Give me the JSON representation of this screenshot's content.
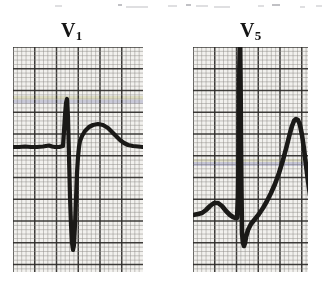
{
  "figure": {
    "kind": "ecg-strip-pair",
    "background_color": "#ffffff",
    "paper_color": "#f2f1ee",
    "grid_color_fine": "#8d8a86",
    "grid_color_bold": "#2e2c2a",
    "trace_color": "#1a1917",
    "tint_blue": "#6f74b4",
    "tint_yellow": "#c9c98a"
  },
  "top_artifacts": [
    {
      "x": 55,
      "y": 5,
      "w": 7
    },
    {
      "x": 118,
      "y": 4,
      "w": 4,
      "dark": true
    },
    {
      "x": 126,
      "y": 6,
      "w": 22
    },
    {
      "x": 168,
      "y": 5,
      "w": 9
    },
    {
      "x": 186,
      "y": 4,
      "w": 5,
      "dark": true
    },
    {
      "x": 196,
      "y": 5,
      "w": 12
    },
    {
      "x": 214,
      "y": 6,
      "w": 16
    },
    {
      "x": 258,
      "y": 5,
      "w": 6
    },
    {
      "x": 272,
      "y": 4,
      "w": 8,
      "dark": true
    },
    {
      "x": 300,
      "y": 6,
      "w": 5
    },
    {
      "x": 316,
      "y": 5,
      "w": 6
    }
  ],
  "panels": [
    {
      "id": "v1",
      "label_main": "V",
      "label_sub": "1",
      "label_x": 61,
      "label_y": 20,
      "box": {
        "x": 13,
        "y": 47,
        "w": 130,
        "h": 225
      },
      "grid": {
        "fine_step": 4.35,
        "bold_every": 5,
        "bold_width": 1.5,
        "fine_width": 0.8
      },
      "baseline_y": 98,
      "tint_bands": [
        {
          "y": 53,
          "h": 3.5,
          "color": "#6f74b4",
          "opacity": 0.3
        },
        {
          "y": 49,
          "h": 3.0,
          "color": "#c9c98a",
          "opacity": 0.4
        }
      ],
      "trace_width": 4.2,
      "trace_points": "0,100 6,100 12,99.5 18,100 24,100 30,99.5 33,99 36,98.5 39,99.5 42,100 46,100 48,99.5 50,99 51,84 52,68 53,56 54,52 55,70 56,110 57,150 58,178 59,196 60,203 61,198 62,178 63,152 64,126 65,110 66,100 67,94 69,89 72,84 76,80 80,78 85,77 90,78 95,81 99,85 103,89 107,93 111,96 115,98 120,99 125,99.5 130,100 130,100",
      "waveform_description": "rS complex: tiny r spike, deep S wave, broad upright T"
    },
    {
      "id": "v5",
      "label_main": "V",
      "label_sub": "5",
      "label_x": 240,
      "label_y": 20,
      "box": {
        "x": 193,
        "y": 47,
        "w": 115,
        "h": 225
      },
      "grid": {
        "fine_step": 4.35,
        "bold_every": 5,
        "bold_width": 1.5,
        "fine_width": 0.8
      },
      "baseline_y": 163,
      "tint_bands": [
        {
          "y": 115,
          "h": 4.0,
          "color": "#6f74b4",
          "opacity": 0.32
        },
        {
          "y": 112,
          "h": 3.0,
          "color": "#c9c98a",
          "opacity": 0.3
        }
      ],
      "trace_width": 4.6,
      "trace_points": "0,168 5,167 9,166 13,163 17,159 21,156 25,156 29,159 33,164 37,168 40,170 42,171 44,171 45,150 45.6,110 46,60 46.4,20 46.8,0 47.2,0 47.6,40 48,95 48.4,140 48.8,170 49,186 50,196 51,199 52,196 53,190 55,183 58,177 62,172 66,167 70,161 74,154 78,146 82,137 86,126 90,113 94,98 97,86 99,79 101,74 103,72 105,73 107,78 109,88 111,102 113,118 115,134 117,148 119,158 121,165 123,169 126,171 130,171 134,170 138,169 142,168",
      "waveform_description": "tall R wave, S dip, markedly elevated asymmetric peaked T wave"
    }
  ]
}
